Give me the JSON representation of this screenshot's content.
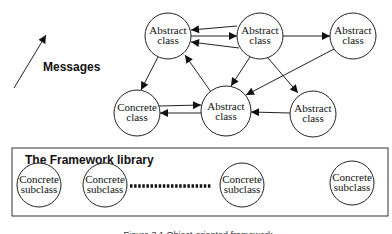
{
  "legend": {
    "label": "Messages"
  },
  "nodes": {
    "a1": {
      "line1": "Abstract",
      "line2": "class"
    },
    "a2": {
      "line1": "Abstract",
      "line2": "class"
    },
    "a3": {
      "line1": "Abstract",
      "line2": "class"
    },
    "c1": {
      "line1": "Concrete",
      "line2": "class"
    },
    "a4": {
      "line1": "Abstract",
      "line2": "class"
    },
    "a5": {
      "line1": "Abstract",
      "line2": "class"
    }
  },
  "library": {
    "title": "The Framework library",
    "subclasses": [
      {
        "line1": "Concrete",
        "line2": "subclass"
      },
      {
        "line1": "Concrete",
        "line2": "subclass"
      },
      {
        "line1": "Concrete",
        "line2": "subclass"
      },
      {
        "line1": "Concrete",
        "line2": "subclass"
      }
    ]
  },
  "caption": {
    "text": "Figure 3.1 Object-oriented framework"
  },
  "colors": {
    "stroke": "#222222",
    "background": "#ffffff"
  }
}
